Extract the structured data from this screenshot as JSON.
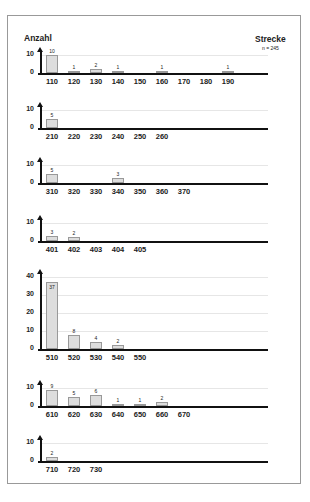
{
  "header": {
    "ylabel": "Anzahl",
    "title": "Strecke",
    "n_label": "n = 245"
  },
  "caption": "",
  "chart_data": [
    {
      "type": "bar",
      "title": "Strecke 110-190",
      "ylabel": "Anzahl",
      "ylim": [
        0,
        10
      ],
      "yticks": [
        0,
        10
      ],
      "categories": [
        "110",
        "120",
        "130",
        "140",
        "150",
        "160",
        "170",
        "180",
        "190"
      ],
      "values": [
        10,
        1,
        2,
        1,
        0,
        1,
        0,
        0,
        1
      ]
    },
    {
      "type": "bar",
      "ylim": [
        0,
        10
      ],
      "yticks": [
        0,
        10
      ],
      "categories": [
        "210",
        "220",
        "230",
        "240",
        "250",
        "260"
      ],
      "values": [
        5,
        0,
        0,
        0,
        0,
        0
      ]
    },
    {
      "type": "bar",
      "ylim": [
        0,
        10
      ],
      "yticks": [
        0,
        10
      ],
      "categories": [
        "310",
        "320",
        "330",
        "340",
        "350",
        "360",
        "370"
      ],
      "values": [
        5,
        0,
        0,
        3,
        0,
        0,
        0
      ]
    },
    {
      "type": "bar",
      "ylim": [
        0,
        10
      ],
      "yticks": [
        0,
        10
      ],
      "categories": [
        "401",
        "402",
        "403",
        "404",
        "405"
      ],
      "values": [
        3,
        2,
        0,
        0,
        0
      ]
    },
    {
      "type": "bar",
      "ylim": [
        0,
        40
      ],
      "yticks": [
        0,
        10,
        20,
        30,
        40
      ],
      "categories": [
        "510",
        "520",
        "530",
        "540",
        "550"
      ],
      "values": [
        37,
        8,
        4,
        2,
        0
      ]
    },
    {
      "type": "bar",
      "ylim": [
        0,
        10
      ],
      "yticks": [
        0,
        10
      ],
      "categories": [
        "610",
        "620",
        "630",
        "640",
        "650",
        "660",
        "670"
      ],
      "values": [
        9,
        5,
        6,
        1,
        1,
        2,
        0
      ]
    },
    {
      "type": "bar",
      "ylim": [
        0,
        10
      ],
      "yticks": [
        0,
        10
      ],
      "categories": [
        "710",
        "720",
        "730"
      ],
      "values": [
        2,
        0,
        0
      ]
    }
  ]
}
